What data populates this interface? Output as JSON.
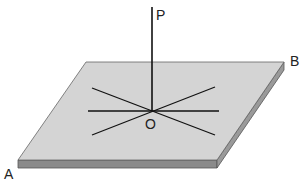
{
  "diagram": {
    "labels": {
      "P": "P",
      "O": "O",
      "A": "A",
      "B": "B"
    },
    "colors": {
      "plate_top": "#d4d4d4",
      "plate_front": "#8a8a8a",
      "plate_side": "#9a9a9a",
      "plate_edge": "#555555",
      "lines": "#111111"
    },
    "lines_through_O": 3
  }
}
